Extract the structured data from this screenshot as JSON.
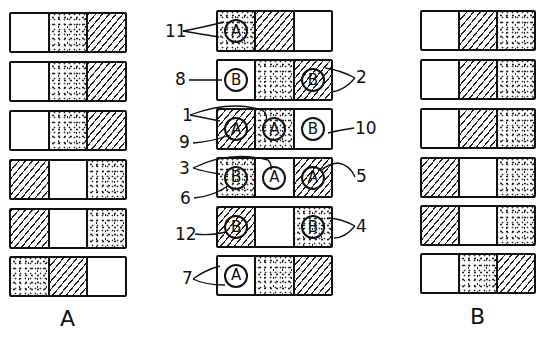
{
  "columns": {
    "A": {
      "label": "A",
      "rows": [
        [
          "blank",
          "dots",
          "hatch"
        ],
        [
          "blank",
          "dots",
          "hatch"
        ],
        [
          "blank",
          "dots",
          "hatch"
        ],
        [
          "hatch",
          "blank",
          "dots"
        ],
        [
          "hatch",
          "blank",
          "dots"
        ],
        [
          "dots",
          "hatch",
          "blank"
        ]
      ]
    },
    "center": {
      "rows": [
        [
          {
            "fill": "dots",
            "marker": "A"
          },
          {
            "fill": "hatch",
            "marker": ""
          },
          {
            "fill": "blank",
            "marker": ""
          }
        ],
        [
          {
            "fill": "blank",
            "marker": "B"
          },
          {
            "fill": "dots",
            "marker": ""
          },
          {
            "fill": "hatch",
            "marker": "B"
          }
        ],
        [
          {
            "fill": "hatch",
            "marker": "A"
          },
          {
            "fill": "dots",
            "marker": "A"
          },
          {
            "fill": "blank",
            "marker": "B"
          }
        ],
        [
          {
            "fill": "dots",
            "marker": "B"
          },
          {
            "fill": "blank",
            "marker": "A"
          },
          {
            "fill": "hatch",
            "marker": "A"
          }
        ],
        [
          {
            "fill": "hatch",
            "marker": "B"
          },
          {
            "fill": "blank",
            "marker": ""
          },
          {
            "fill": "dots",
            "marker": "B"
          }
        ],
        [
          {
            "fill": "blank",
            "marker": "A"
          },
          {
            "fill": "dots",
            "marker": ""
          },
          {
            "fill": "hatch",
            "marker": ""
          }
        ]
      ],
      "reference_numbers": {
        "n11": "11",
        "n8": "8",
        "n2": "2",
        "n1": "1",
        "n9": "9",
        "n10": "10",
        "n3": "3",
        "n5": "5",
        "n6": "6",
        "n12": "12",
        "n4": "4",
        "n7": "7"
      }
    },
    "B": {
      "label": "B",
      "rows": [
        [
          "blank",
          "hatch",
          "dots"
        ],
        [
          "blank",
          "hatch",
          "dots"
        ],
        [
          "blank",
          "hatch",
          "dots"
        ],
        [
          "hatch",
          "blank",
          "dots"
        ],
        [
          "hatch",
          "blank",
          "dots"
        ],
        [
          "blank",
          "dots",
          "hatch"
        ]
      ]
    }
  },
  "colors": {
    "ink": "#111111",
    "paper": "#ffffff"
  }
}
